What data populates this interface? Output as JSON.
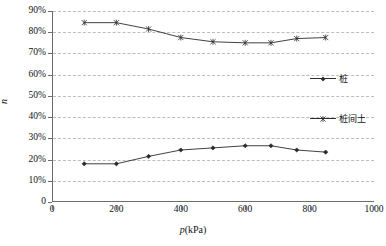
{
  "chart_data": {
    "type": "line",
    "title": "",
    "subtitle": "",
    "xlabel": "p(kPa)",
    "ylabel": "n",
    "xlim": [
      0,
      1000
    ],
    "ylim": [
      0,
      0.9
    ],
    "x_ticks": [
      0,
      200,
      400,
      600,
      800,
      1000
    ],
    "x_tick_labels": [
      "0",
      "200",
      "400",
      "600",
      "800",
      "1000"
    ],
    "y_ticks": [
      0,
      0.1,
      0.2,
      0.3,
      0.4,
      0.5,
      0.6,
      0.7,
      0.8,
      0.9
    ],
    "y_tick_labels": [
      "0",
      "10%",
      "20%",
      "30%",
      "40%",
      "50%",
      "60%",
      "70%",
      "80%",
      "90%"
    ],
    "grid": "horizontal-dashed",
    "legend_position": "inside-right",
    "series": [
      {
        "name": "桩",
        "marker": "diamond",
        "color": "#2b2b2b",
        "x": [
          100,
          200,
          300,
          400,
          500,
          600,
          680,
          760,
          850
        ],
        "values": [
          0.18,
          0.18,
          0.215,
          0.245,
          0.255,
          0.265,
          0.265,
          0.245,
          0.235
        ]
      },
      {
        "name": "桩间土",
        "marker": "cross",
        "color": "#2b2b2b",
        "x": [
          100,
          200,
          300,
          400,
          500,
          600,
          680,
          760,
          850
        ],
        "values": [
          0.845,
          0.845,
          0.815,
          0.775,
          0.755,
          0.75,
          0.75,
          0.77,
          0.775
        ]
      }
    ]
  },
  "axes": {
    "y_title": "n",
    "x_title_italic": "p",
    "x_title_rest": "(kPa)"
  },
  "legend": {
    "entries": [
      {
        "label": "桩",
        "marker": "diamond"
      },
      {
        "label": "桩间土",
        "marker": "cross"
      }
    ]
  }
}
